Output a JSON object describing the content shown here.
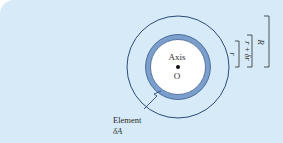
{
  "diagram": {
    "type": "annular element of circular section",
    "colors": {
      "background": "#d6ebf7",
      "ring_fill": "#7b9fcc",
      "ring_stroke": "#3a5a8c",
      "outer_circle": "#2e4a78",
      "inner_fill": "#ffffff",
      "text": "#2b2b2b"
    },
    "labels": {
      "axis": "Axis",
      "origin": "O",
      "element_line1": "Element",
      "element_line2": "δA",
      "dim_r": "r",
      "dim_r_dr": "r + δr",
      "dim_R": "R"
    }
  }
}
